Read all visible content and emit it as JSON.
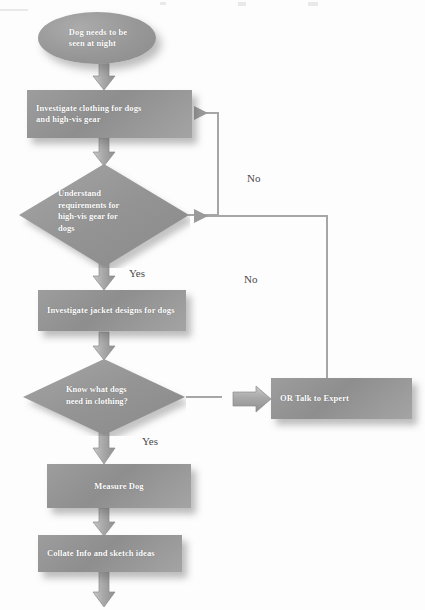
{
  "diagram": {
    "type": "flowchart",
    "colors": {
      "node_fill": "#949494",
      "node_text": "#ffffff",
      "connector": "#9a9a9a",
      "arrow_fill": "#a8a8a8",
      "edge_label_text": "#4a4a4a",
      "background": "#fdfdfd"
    },
    "nodes": [
      {
        "id": "start",
        "shape": "ellipse",
        "label": "Dog needs to be seen at night",
        "line1": "Dog needs to be",
        "line2": "seen at night"
      },
      {
        "id": "investigate-clothing",
        "shape": "process",
        "label": "Investigate clothing for dogs and high-vis gear",
        "line1": "Investigate clothing for dogs",
        "line2": "and high-vis gear"
      },
      {
        "id": "understand-requirements",
        "shape": "decision",
        "label": "Understand requirements for high-vis gear for dogs",
        "line1": "Understand",
        "line2": "requirements for",
        "line3": "high-vis gear for",
        "line4": "dogs"
      },
      {
        "id": "investigate-jacket-designs",
        "shape": "process",
        "label": "Investigate jacket designs for dogs"
      },
      {
        "id": "know-what-dogs-need",
        "shape": "decision",
        "label": "Know what dogs need in clothing?",
        "line1": "Know what dogs",
        "line2": "need in clothing?"
      },
      {
        "id": "talk-to-expert",
        "shape": "process",
        "label": "OR Talk to Expert"
      },
      {
        "id": "measure-dog",
        "shape": "process",
        "label": "Measure Dog"
      },
      {
        "id": "collate-info",
        "shape": "process",
        "label": "Collate Info and sketch ideas"
      }
    ],
    "edge_labels": {
      "yes_upper": "Yes",
      "yes_lower": "Yes",
      "no_upper": "No",
      "no_lower": "No"
    },
    "edges": [
      {
        "from": "start",
        "to": "investigate-clothing",
        "label": ""
      },
      {
        "from": "investigate-clothing",
        "to": "understand-requirements",
        "label": ""
      },
      {
        "from": "understand-requirements",
        "to": "investigate-jacket-designs",
        "label": "Yes"
      },
      {
        "from": "understand-requirements",
        "to": "investigate-clothing",
        "label": "No"
      },
      {
        "from": "investigate-jacket-designs",
        "to": "know-what-dogs-need",
        "label": ""
      },
      {
        "from": "know-what-dogs-need",
        "to": "measure-dog",
        "label": "Yes"
      },
      {
        "from": "know-what-dogs-need",
        "to": "talk-to-expert",
        "label": ""
      },
      {
        "from": "talk-to-expert",
        "to": "understand-requirements",
        "label": "No"
      },
      {
        "from": "measure-dog",
        "to": "collate-info",
        "label": ""
      },
      {
        "from": "collate-info",
        "to": "",
        "label": ""
      }
    ]
  }
}
